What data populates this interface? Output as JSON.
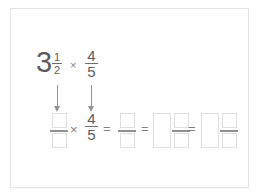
{
  "colors": {
    "background": "#ffffff",
    "card_border": "#e3e3e3",
    "text": "#5c5c5c",
    "operator": "#808080",
    "arrow": "#949494",
    "input_box_border": "#dedede",
    "answer_fraction_line": "#909090"
  },
  "problem": {
    "whole": "3",
    "mixed_fraction": {
      "numerator": "1",
      "denominator": "2"
    },
    "times": "×",
    "fraction": {
      "numerator": "4",
      "denominator": "5"
    }
  },
  "work": {
    "times": "×",
    "fraction": {
      "numerator": "4",
      "denominator": "5"
    },
    "equals": "="
  }
}
